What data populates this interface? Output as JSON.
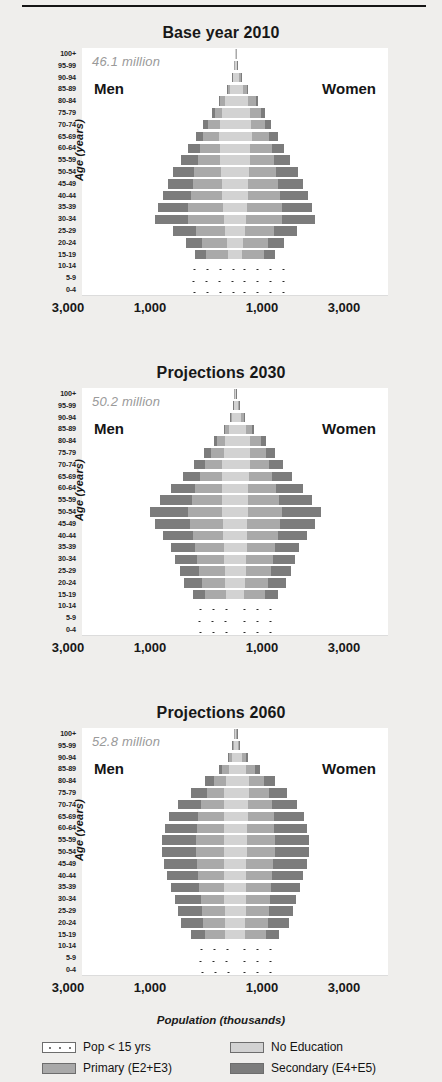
{
  "figure": {
    "xaxis_title": "Population (thousands)",
    "yaxis_title": "Age (years)",
    "men_label": "Men",
    "women_label": "Women",
    "x_ticks": [
      "3,000",
      "1,000",
      "1,000",
      "3,000"
    ],
    "age_groups": [
      "100+",
      "95-99",
      "90-94",
      "85-89",
      "80-84",
      "75-79",
      "70-74",
      "65-69",
      "60-64",
      "55-59",
      "50-54",
      "45-49",
      "40-44",
      "35-39",
      "30-34",
      "25-29",
      "20-24",
      "15-19",
      "10-14",
      "5-9",
      "0-4"
    ],
    "colors": {
      "no_education": "#d2d2d2",
      "primary": "#a9a9a9",
      "secondary": "#7c7c7c",
      "pop_under_15": "#ffffff",
      "total_text": "#9a9a9a"
    }
  },
  "legend": {
    "items": [
      {
        "label": "Pop < 15 yrs",
        "swatch": "kids"
      },
      {
        "label": "No Education",
        "swatch": "noedu"
      },
      {
        "label": "Primary (E2+E3)",
        "swatch": "primary"
      },
      {
        "label": "Secondary (E4+E5)",
        "swatch": "secondary"
      }
    ]
  },
  "chart_data": {
    "type": "bar",
    "subtype": "population-pyramid",
    "xlabel": "Population (thousands)",
    "ylabel": "Age (years)",
    "xlim": [
      -4000,
      4000
    ],
    "x_tick_values": [
      -3000,
      -1000,
      1000,
      3000
    ],
    "x_tick_labels": [
      "3,000",
      "1,000",
      "1,000",
      "3,000"
    ],
    "grid": false,
    "legend_position": "bottom",
    "categories": [
      "100+",
      "95-99",
      "90-94",
      "85-89",
      "80-84",
      "75-79",
      "70-74",
      "65-69",
      "60-64",
      "55-59",
      "50-54",
      "45-49",
      "40-44",
      "35-39",
      "30-34",
      "25-29",
      "20-24",
      "15-19",
      "10-14",
      "5-9",
      "0-4"
    ],
    "stack_order": [
      "no_education",
      "primary",
      "secondary"
    ],
    "panels": [
      {
        "title": "Base year 2010",
        "total": "46.1 million",
        "men": {
          "no_education": [
            10,
            20,
            60,
            130,
            250,
            330,
            400,
            430,
            400,
            380,
            360,
            340,
            330,
            320,
            300,
            250,
            210,
            190,
            0,
            0,
            0
          ],
          "primary": [
            2,
            6,
            25,
            60,
            130,
            200,
            300,
            400,
            520,
            600,
            700,
            760,
            820,
            900,
            940,
            760,
            640,
            560,
            0,
            0,
            0
          ],
          "secondary": [
            0,
            2,
            6,
            18,
            45,
            80,
            130,
            200,
            300,
            420,
            560,
            660,
            740,
            800,
            860,
            620,
            440,
            300,
            0,
            0,
            0
          ],
          "pop_under_15": [
            0,
            0,
            0,
            0,
            0,
            0,
            0,
            0,
            0,
            0,
            0,
            0,
            0,
            0,
            0,
            0,
            0,
            0,
            1320,
            1340,
            1300
          ]
        },
        "women": {
          "no_education": [
            20,
            45,
            110,
            220,
            350,
            400,
            430,
            440,
            400,
            380,
            360,
            350,
            335,
            325,
            300,
            250,
            210,
            190,
            0,
            0,
            0
          ],
          "primary": [
            4,
            12,
            40,
            95,
            190,
            280,
            360,
            450,
            560,
            640,
            720,
            780,
            830,
            900,
            930,
            760,
            640,
            560,
            0,
            0,
            0
          ],
          "secondary": [
            1,
            3,
            10,
            25,
            60,
            100,
            150,
            230,
            320,
            430,
            560,
            660,
            740,
            800,
            850,
            620,
            440,
            300,
            0,
            0,
            0
          ],
          "pop_under_15": [
            0,
            0,
            0,
            0,
            0,
            0,
            0,
            0,
            0,
            0,
            0,
            0,
            0,
            0,
            0,
            0,
            0,
            0,
            1320,
            1340,
            1300
          ]
        }
      },
      {
        "title": "Projections 2030",
        "total": "50.2 million",
        "men": {
          "no_education": [
            15,
            30,
            80,
            150,
            250,
            300,
            330,
            340,
            340,
            330,
            330,
            320,
            310,
            300,
            290,
            270,
            250,
            230,
            0,
            0,
            0
          ],
          "primary": [
            4,
            12,
            45,
            110,
            220,
            330,
            450,
            580,
            700,
            800,
            900,
            860,
            800,
            740,
            700,
            660,
            620,
            560,
            0,
            0,
            0
          ],
          "secondary": [
            1,
            4,
            14,
            40,
            90,
            170,
            290,
            450,
            640,
            820,
            1000,
            900,
            760,
            640,
            580,
            520,
            470,
            320,
            0,
            0,
            0
          ],
          "pop_under_15": [
            0,
            0,
            0,
            0,
            0,
            0,
            0,
            0,
            0,
            0,
            0,
            0,
            0,
            0,
            0,
            0,
            0,
            0,
            1160,
            1180,
            1140
          ]
        },
        "women": {
          "no_education": [
            30,
            70,
            160,
            280,
            380,
            400,
            380,
            360,
            350,
            340,
            335,
            325,
            315,
            305,
            295,
            275,
            255,
            235,
            0,
            0,
            0
          ],
          "primary": [
            8,
            22,
            70,
            160,
            290,
            400,
            500,
            620,
            730,
            820,
            900,
            860,
            800,
            740,
            700,
            660,
            620,
            560,
            0,
            0,
            0
          ],
          "secondary": [
            2,
            7,
            24,
            65,
            140,
            240,
            370,
            520,
            700,
            860,
            1010,
            900,
            760,
            640,
            580,
            520,
            470,
            320,
            0,
            0,
            0
          ],
          "pop_under_15": [
            0,
            0,
            0,
            0,
            0,
            0,
            0,
            0,
            0,
            0,
            0,
            0,
            0,
            0,
            0,
            0,
            0,
            0,
            1160,
            1180,
            1140
          ]
        }
      },
      {
        "title": "Projections 2060",
        "total": "52.8 million",
        "men": {
          "no_education": [
            20,
            40,
            90,
            160,
            240,
            280,
            300,
            300,
            300,
            300,
            300,
            290,
            285,
            280,
            275,
            270,
            260,
            250,
            0,
            0,
            0
          ],
          "primary": [
            6,
            20,
            70,
            170,
            320,
            460,
            580,
            660,
            700,
            720,
            720,
            700,
            680,
            650,
            620,
            600,
            580,
            540,
            0,
            0,
            0
          ],
          "secondary": [
            2,
            8,
            30,
            90,
            220,
            400,
            600,
            760,
            840,
            880,
            900,
            860,
            800,
            740,
            680,
            620,
            560,
            360,
            0,
            0,
            0
          ],
          "pop_under_15": [
            0,
            0,
            0,
            0,
            0,
            0,
            0,
            0,
            0,
            0,
            0,
            0,
            0,
            0,
            0,
            0,
            0,
            0,
            1120,
            1140,
            1100
          ]
        },
        "women": {
          "no_education": [
            35,
            80,
            170,
            280,
            360,
            370,
            350,
            330,
            320,
            315,
            310,
            300,
            295,
            290,
            285,
            278,
            268,
            255,
            0,
            0,
            0
          ],
          "primary": [
            12,
            35,
            110,
            240,
            400,
            520,
            620,
            680,
            710,
            725,
            725,
            705,
            685,
            655,
            625,
            605,
            585,
            545,
            0,
            0,
            0
          ],
          "secondary": [
            4,
            14,
            50,
            130,
            290,
            470,
            650,
            790,
            855,
            890,
            905,
            865,
            805,
            745,
            685,
            625,
            565,
            360,
            0,
            0,
            0
          ],
          "pop_under_15": [
            0,
            0,
            0,
            0,
            0,
            0,
            0,
            0,
            0,
            0,
            0,
            0,
            0,
            0,
            0,
            0,
            0,
            0,
            1120,
            1140,
            1100
          ]
        }
      }
    ]
  }
}
